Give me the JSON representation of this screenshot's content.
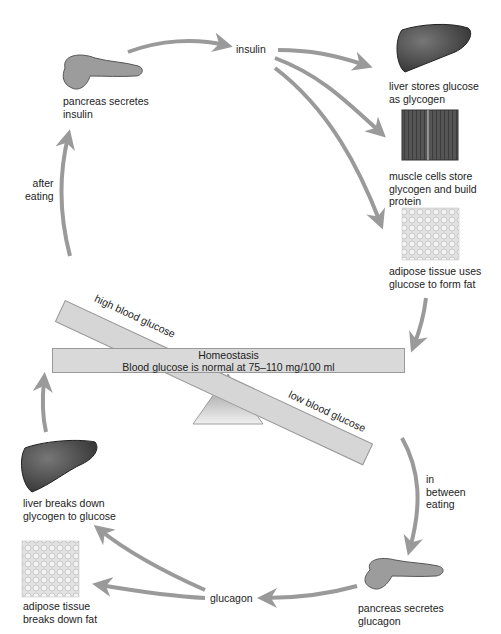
{
  "diagram": {
    "center": {
      "heading": "Homeostasis",
      "subtext": "Blood glucose is normal at 75–110 mg/100 ml"
    },
    "tilted_beam": {
      "high_label": "high blood glucose",
      "low_label": "low blood glucose"
    },
    "top": {
      "pancreas_label": "pancreas secretes\ninsulin",
      "hormone_label": "insulin",
      "trigger_label": "after\neating",
      "targets": [
        {
          "icon": "liver-icon",
          "label": "liver stores glucose\nas glycogen"
        },
        {
          "icon": "muscle-icon",
          "label": "muscle cells store\nglycogen and build\nprotein"
        },
        {
          "icon": "adipose-icon",
          "label": "adipose tissue uses\nglucose to form fat"
        }
      ]
    },
    "bottom": {
      "pancreas_label": "pancreas secretes\nglucagon",
      "hormone_label": "glucagon",
      "trigger_label": "in\nbetween\neating",
      "targets": [
        {
          "icon": "liver-icon",
          "label": "liver breaks down\nglycogen to glucose"
        },
        {
          "icon": "adipose-icon",
          "label": "adipose tissue\nbreaks down fat"
        }
      ]
    },
    "colors": {
      "arrow": "#9a9a9a",
      "beam": "#d8d8d8",
      "liver": "#4a4a4a",
      "fulcrum": "#bdbdbd"
    }
  }
}
